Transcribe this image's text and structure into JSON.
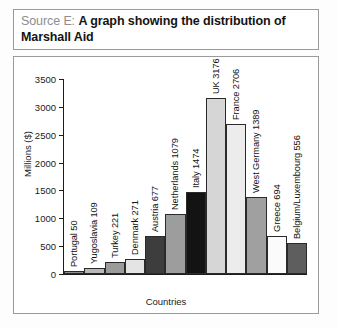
{
  "title": {
    "source_label": "Source E:",
    "main_text": "A graph showing the distribution of Marshall Aid"
  },
  "chart_data": {
    "type": "bar",
    "title": "A graph showing the distribution of Marshall Aid",
    "xlabel": "Countries",
    "ylabel": "Millions ($)",
    "ylim": [
      0,
      3500
    ],
    "yticks": [
      0,
      500,
      1000,
      1500,
      2000,
      2500,
      3000,
      3500
    ],
    "grid": false,
    "legend": "none",
    "categories": [
      "Portugal",
      "Yugoslavia",
      "Turkey",
      "Denmark",
      "Austria",
      "Netherlands",
      "Italy",
      "UK",
      "France",
      "West Germany",
      "Greece",
      "Belgium/Luxembourg"
    ],
    "values": [
      50,
      109,
      221,
      271,
      677,
      1079,
      1474,
      3176,
      2706,
      1389,
      694,
      556
    ],
    "bars": [
      {
        "name": "Portugal",
        "value": 50,
        "label": "Portugal 50",
        "color": "#8f8f8f"
      },
      {
        "name": "Yugoslavia",
        "value": 109,
        "label": "Yugoslavia 109",
        "color": "#b9b9b9"
      },
      {
        "name": "Turkey",
        "value": 221,
        "label": "Turkey 221",
        "color": "#9b9b9b"
      },
      {
        "name": "Denmark",
        "value": 271,
        "label": "Denmark 271",
        "color": "#e4e4e4"
      },
      {
        "name": "Austria",
        "value": 677,
        "label": "Austria 677",
        "color": "#3d3d3d"
      },
      {
        "name": "Netherlands",
        "value": 1079,
        "label": "Netherlands 1079",
        "color": "#9d9d9d"
      },
      {
        "name": "Italy",
        "value": 1474,
        "label": "Italy 1474",
        "color": "#131313"
      },
      {
        "name": "UK",
        "value": 3176,
        "label": "UK 3176",
        "color": "#d6d6d6"
      },
      {
        "name": "France",
        "value": 2706,
        "label": "France 2706",
        "color": "#ececec"
      },
      {
        "name": "West Germany",
        "value": 1389,
        "label": "West Germany 1389",
        "color": "#a0a0a0"
      },
      {
        "name": "Greece",
        "value": 694,
        "label": "Greece 694",
        "color": "#fbfbfb"
      },
      {
        "name": "Belgium/Luxembourg",
        "value": 556,
        "label": "Belgium/Luxembourg 556",
        "color": "#5e5e5e"
      }
    ]
  }
}
